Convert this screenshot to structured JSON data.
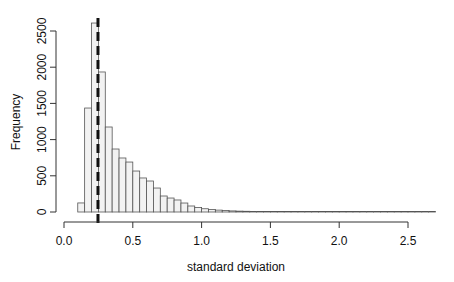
{
  "chart_data": {
    "type": "bar",
    "title": "",
    "xlabel": "standard deviation",
    "ylabel": "Frequency",
    "xlim": [
      0.0,
      2.75
    ],
    "ylim": [
      0,
      2600
    ],
    "x_ticks": [
      "0.0",
      "0.5",
      "1.0",
      "1.5",
      "2.0",
      "2.5"
    ],
    "y_ticks": [
      "0",
      "500",
      "1000",
      "1500",
      "2000",
      "2500"
    ],
    "bin_width": 0.05,
    "bin_start": 0.1,
    "values": [
      125,
      1436,
      2610,
      1934,
      1174,
      870,
      746,
      690,
      566,
      470,
      428,
      331,
      221,
      193,
      166,
      124,
      83,
      62,
      45,
      35,
      26,
      20,
      15,
      12,
      10,
      8,
      6,
      5,
      4,
      3,
      3,
      2,
      2,
      2,
      1,
      1,
      1,
      1,
      1,
      1,
      1,
      1,
      1,
      1,
      1,
      1,
      1,
      1,
      1,
      1,
      1,
      1
    ],
    "reference_line": {
      "x": 0.247,
      "style": "dashed"
    },
    "grid": false,
    "bar_fill": "#f2f2f2",
    "bar_stroke": "#555555"
  }
}
